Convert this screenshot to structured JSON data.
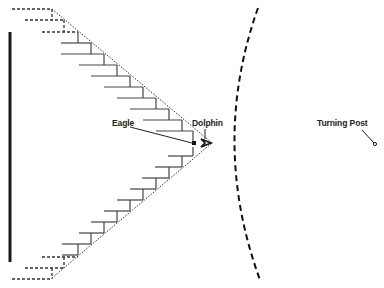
{
  "diagram": {
    "type": "race-start-formation",
    "labels": {
      "eagle": "Eagle",
      "dolphin": "Dolphin",
      "turning_post": "Turning Post"
    },
    "colors": {
      "ink": "#222222",
      "background": "#ffffff"
    },
    "elements": {
      "start_line": "solid vertical bar at left",
      "formation": "V-shaped staircase of dotted boundary lines converging to an apex",
      "arc": "dashed curved line to the right of the apex",
      "turning_post": "small circle marker"
    }
  }
}
